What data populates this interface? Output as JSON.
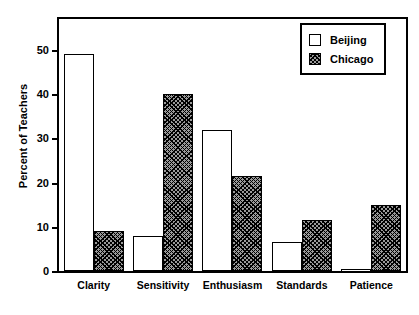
{
  "chart_data": {
    "type": "bar",
    "title": "",
    "xlabel": "",
    "ylabel": "Percent of Teachers",
    "categories": [
      "Clarity",
      "Sensitivity",
      "Enthusiasm",
      "Standards",
      "Patience"
    ],
    "series": [
      {
        "name": "Beijing",
        "values": [
          49,
          8,
          32,
          6.5,
          0.3
        ],
        "fill": "white",
        "pattern": "solid-open"
      },
      {
        "name": "Chicago",
        "values": [
          9,
          40,
          21.5,
          11.5,
          15
        ],
        "fill": "#9a9a9a",
        "pattern": "diagonal-crosshatch"
      }
    ],
    "ylim": [
      0,
      57
    ],
    "yticks": [
      0,
      10,
      20,
      30,
      40,
      50
    ],
    "ytick_labels": [
      "0",
      "10",
      "20",
      "30",
      "40",
      "50"
    ],
    "grid": false,
    "legend_position": "top-right",
    "legend_entries": [
      "Beijing",
      "Chicago"
    ]
  }
}
